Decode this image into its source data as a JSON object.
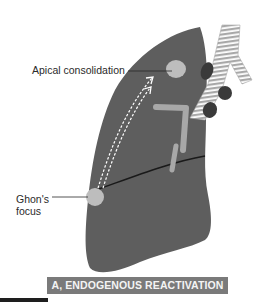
{
  "figure": {
    "labels": {
      "apical": "Apical consolidation",
      "ghon": "Ghon's focus"
    },
    "caption": "A, ENDOGENOUS REACTIVATION"
  },
  "colors": {
    "lung": "#5e5e5e",
    "lesion": "#bdbdbd",
    "trachea_stripe": "#a8a8a8",
    "lymph_node": "#3a3a3a",
    "caption_bg": "#7a7a7a",
    "caption_text": "#f4f4f4"
  }
}
